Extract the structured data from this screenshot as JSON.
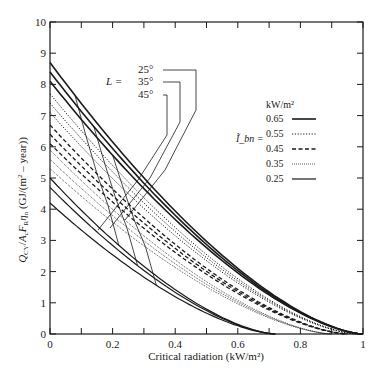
{
  "chart_data": {
    "type": "line",
    "title": "",
    "xlabel": "Critical radiation (kW/m²)",
    "ylabel": "Q_CY / A_c F_R η_n  (GJ/(m² – year))",
    "xlim": [
      0,
      1
    ],
    "ylim": [
      0,
      10
    ],
    "xticks": [
      "0",
      "0.2",
      "0.4",
      "0.6",
      "0.8",
      "1"
    ],
    "yticks": [
      "0",
      "1",
      "2",
      "3",
      "4",
      "5",
      "6",
      "7",
      "8",
      "9",
      "10"
    ],
    "grid": false,
    "legend": {
      "position": "right-middle",
      "symbol": "Ĩ_bn =",
      "unit": "kW/m²",
      "entries": [
        {
          "label": "0.65",
          "style": "solid-thick"
        },
        {
          "label": "0.55",
          "style": "dotted"
        },
        {
          "label": "0.45",
          "style": "dashed"
        },
        {
          "label": "0.35",
          "style": "fine-dotted"
        },
        {
          "label": "0.25",
          "style": "solid"
        }
      ]
    },
    "latitude_annotation": {
      "prefix": "L =",
      "labels": [
        "25°",
        "35°",
        "45°"
      ]
    },
    "series": [
      {
        "name": "0.65 kW/m², L=25°",
        "intensity": 0.65,
        "latitude": "25°",
        "style": "solid-thick",
        "y0": 8.7,
        "x_end": 1.0
      },
      {
        "name": "0.65 kW/m², L=35°",
        "intensity": 0.65,
        "latitude": "35°",
        "style": "solid-thick",
        "y0": 8.4,
        "x_end": 1.0
      },
      {
        "name": "0.65 kW/m², L=45°",
        "intensity": 0.65,
        "latitude": "45°",
        "style": "solid-thick",
        "y0": 8.1,
        "x_end": 1.0
      },
      {
        "name": "0.55 kW/m², L=25°",
        "intensity": 0.55,
        "latitude": "25°",
        "style": "dotted",
        "y0": 7.7,
        "x_end": 0.98
      },
      {
        "name": "0.55 kW/m², L=35°",
        "intensity": 0.55,
        "latitude": "35°",
        "style": "dotted",
        "y0": 7.4,
        "x_end": 0.98
      },
      {
        "name": "0.55 kW/m², L=45°",
        "intensity": 0.55,
        "latitude": "45°",
        "style": "dotted",
        "y0": 7.1,
        "x_end": 0.98
      },
      {
        "name": "0.45 kW/m², L=25°",
        "intensity": 0.45,
        "latitude": "25°",
        "style": "dashed",
        "y0": 6.7,
        "x_end": 0.95
      },
      {
        "name": "0.45 kW/m², L=35°",
        "intensity": 0.45,
        "latitude": "35°",
        "style": "dashed",
        "y0": 6.4,
        "x_end": 0.95
      },
      {
        "name": "0.45 kW/m², L=45°",
        "intensity": 0.45,
        "latitude": "45°",
        "style": "dashed",
        "y0": 6.1,
        "x_end": 0.95
      },
      {
        "name": "0.35 kW/m², L=25°",
        "intensity": 0.35,
        "latitude": "25°",
        "style": "fine-dotted",
        "y0": 5.9,
        "x_end": 0.9
      },
      {
        "name": "0.35 kW/m², L=35°",
        "intensity": 0.35,
        "latitude": "35°",
        "style": "fine-dotted",
        "y0": 5.6,
        "x_end": 0.9
      },
      {
        "name": "0.35 kW/m², L=45°",
        "intensity": 0.35,
        "latitude": "45°",
        "style": "fine-dotted",
        "y0": 5.3,
        "x_end": 0.9
      },
      {
        "name": "0.25 kW/m², L=25°",
        "intensity": 0.25,
        "latitude": "25°",
        "style": "solid",
        "y0": 5.0,
        "x_end": 0.72
      },
      {
        "name": "0.25 kW/m², L=35°",
        "intensity": 0.25,
        "latitude": "35°",
        "style": "solid",
        "y0": 4.7,
        "x_end": 0.72
      },
      {
        "name": "0.25 kW/m², L=45°",
        "intensity": 0.25,
        "latitude": "45°",
        "style": "solid",
        "y0": 4.2,
        "x_end": 0.72
      }
    ]
  }
}
